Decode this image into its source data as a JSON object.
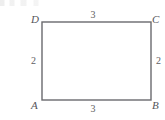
{
  "figure": {
    "kind": "rectangle-diagram",
    "background_color": "#ffffff",
    "stroke_color": "#6a6a6e",
    "label_color": "#55555a",
    "vertices": {
      "top_left": "D",
      "top_right": "C",
      "bottom_left": "A",
      "bottom_right": "B"
    },
    "side_lengths": {
      "top": "3",
      "bottom": "3",
      "left": "2",
      "right": "2"
    }
  }
}
